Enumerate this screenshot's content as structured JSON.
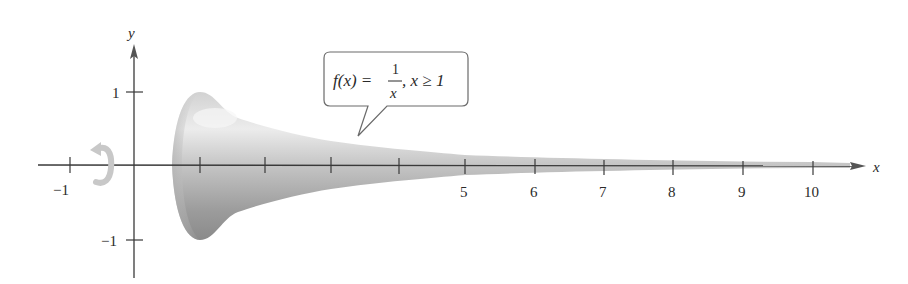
{
  "figure": {
    "callout": {
      "func": "f(x) = ",
      "numerator": "1",
      "denominator": "x",
      "condition": ", x ≥ 1"
    },
    "axes": {
      "x_label": "x",
      "y_label": "y",
      "x_ticks": [
        -1,
        1,
        2,
        3,
        4,
        5,
        6,
        7,
        8,
        9,
        10
      ],
      "x_tick_labels": {
        "neg1": "−1",
        "t5": "5",
        "t6": "6",
        "t7": "7",
        "t8": "8",
        "t9": "9",
        "t10": "10"
      },
      "y_tick_labels": {
        "pos1": "1",
        "neg1": "−1"
      }
    },
    "rotation_icon": "rotate-arrow-icon",
    "colors": {
      "horn_light": "#e6e6e6",
      "horn_mid": "#bdbdbd",
      "horn_dark": "#8e8e8e",
      "axis": "#3a3a3a",
      "callout_border": "#6a6a6a",
      "rotation_arrow": "#c8c8c8"
    }
  }
}
